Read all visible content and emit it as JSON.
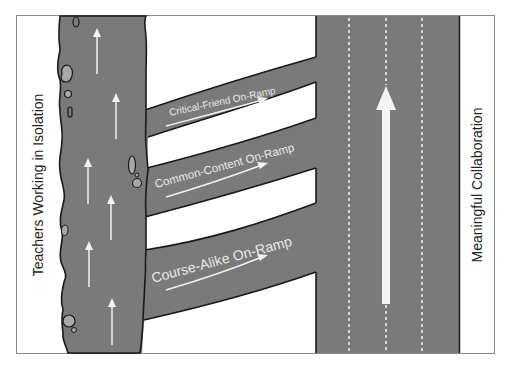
{
  "diagram": {
    "left_label": "Teachers Working in Isolation",
    "right_label": "Meaningful Collaboration",
    "ramps": [
      {
        "label": "Critical-Friend On-Ramp"
      },
      {
        "label": "Common-Content On-Ramp"
      },
      {
        "label": "Course-Alike On-Ramp"
      }
    ],
    "colors": {
      "road": "#7a7a7a",
      "road_edge": "#1a1a1a",
      "marking": "#f2f2f2",
      "rock": "#a8a8a8",
      "background": "#ffffff",
      "frame": "#888888",
      "label": "#222222"
    }
  }
}
